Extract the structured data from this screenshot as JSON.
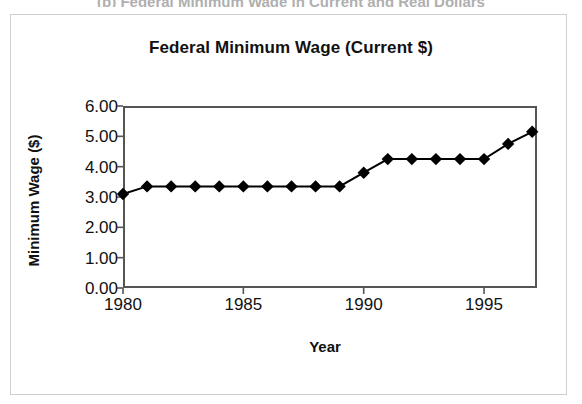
{
  "figure": {
    "top_cropped_caption": "(b)  Federal Minimum Wage in Current and Real Dollars",
    "outer_border_color": "#cfcfcf",
    "background_color": "#ffffff"
  },
  "chart_data": {
    "type": "line",
    "title": "Federal Minimum Wage (Current $)",
    "xlabel": "Year",
    "ylabel": "Minimum Wage ($)",
    "xlim": [
      1980,
      1997.2
    ],
    "ylim": [
      0.0,
      6.0
    ],
    "ytick_labels": [
      "6.00",
      "5.00",
      "4.00",
      "3.00",
      "2.00",
      "1.00",
      "0.00"
    ],
    "ytick_values": [
      6.0,
      5.0,
      4.0,
      3.0,
      2.0,
      1.0,
      0.0
    ],
    "xtick_labels": [
      "1980",
      "1985",
      "1990",
      "1995"
    ],
    "xtick_values": [
      1980,
      1985,
      1990,
      1995
    ],
    "grid": false,
    "legend": "none",
    "marker": "filled-diamond",
    "marker_color": "#000000",
    "line_color": "#000000",
    "series": [
      {
        "name": "Federal Minimum Wage (Current $)",
        "x": [
          1980,
          1981,
          1982,
          1983,
          1984,
          1985,
          1986,
          1987,
          1988,
          1989,
          1990,
          1991,
          1992,
          1993,
          1994,
          1995,
          1996,
          1997
        ],
        "values": [
          3.1,
          3.35,
          3.35,
          3.35,
          3.35,
          3.35,
          3.35,
          3.35,
          3.35,
          3.35,
          3.8,
          4.25,
          4.25,
          4.25,
          4.25,
          4.25,
          4.75,
          5.15
        ]
      }
    ]
  }
}
